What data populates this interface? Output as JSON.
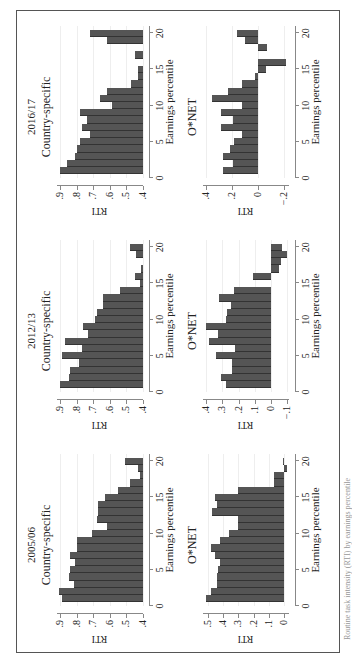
{
  "figure": {
    "caption": "Routine task intensity (RTI) by earnings percentile"
  },
  "columns": [
    {
      "year": "2005/06"
    },
    {
      "year": "2012/13"
    },
    {
      "year": "2016/17"
    }
  ],
  "chart_data": [
    {
      "type": "bar",
      "title": "2005/06 — Country-specific",
      "panel_label": "Country-specific",
      "xlabel": "Earnings percentile",
      "ylabel": "RTI",
      "x": [
        1,
        2,
        3,
        4,
        5,
        6,
        7,
        8,
        9,
        10,
        11,
        12,
        13,
        14,
        15,
        16,
        17,
        18,
        19,
        20
      ],
      "values": [
        0.89,
        0.91,
        0.82,
        0.85,
        0.84,
        0.81,
        0.84,
        0.8,
        0.8,
        0.71,
        0.62,
        0.68,
        0.67,
        0.67,
        0.63,
        0.55,
        0.48,
        0.42,
        0.43,
        0.51
      ],
      "xticks": [
        0,
        5,
        10,
        15,
        20
      ],
      "yticks": [
        ".4",
        ".5",
        ".6",
        ".7",
        ".8",
        ".9"
      ],
      "ylim": [
        0.4,
        0.92
      ],
      "xlim": [
        0,
        21
      ],
      "grid": true
    },
    {
      "type": "bar",
      "title": "2005/06 — O*NET",
      "panel_label": "O*NET",
      "xlabel": "Earnings percentile",
      "ylabel": "RTI",
      "x": [
        1,
        2,
        3,
        4,
        5,
        6,
        7,
        8,
        9,
        10,
        11,
        12,
        13,
        14,
        15,
        16,
        17,
        18,
        19,
        20
      ],
      "values": [
        0.51,
        0.48,
        0.44,
        0.44,
        0.43,
        0.42,
        0.45,
        0.48,
        0.42,
        0.36,
        0.3,
        0.3,
        0.47,
        0.44,
        0.45,
        0.3,
        0.07,
        0.07,
        -0.02,
        0.01
      ],
      "xticks": [
        0,
        5,
        10,
        15,
        20
      ],
      "yticks": [
        "0",
        ".1",
        ".2",
        ".3",
        ".4",
        ".5"
      ],
      "ylim": [
        -0.03,
        0.53
      ],
      "xlim": [
        0,
        21
      ],
      "grid": true
    },
    {
      "type": "bar",
      "title": "2012/13 — Country-specific",
      "panel_label": "Country-specific",
      "xlabel": "Earnings percentile",
      "ylabel": "RTI",
      "x": [
        1,
        2,
        3,
        4,
        5,
        6,
        7,
        8,
        9,
        10,
        11,
        12,
        13,
        14,
        15,
        16,
        17,
        18,
        19,
        20
      ],
      "values": [
        0.9,
        0.85,
        0.84,
        0.79,
        0.89,
        0.77,
        0.87,
        0.73,
        0.76,
        0.69,
        0.68,
        0.64,
        0.64,
        0.54,
        0.42,
        0.45,
        0.41,
        0.4,
        0.44,
        0.48
      ],
      "xticks": [
        0,
        5,
        10,
        15,
        20
      ],
      "yticks": [
        ".4",
        ".5",
        ".6",
        ".7",
        ".8",
        ".9"
      ],
      "ylim": [
        0.4,
        0.92
      ],
      "xlim": [
        0,
        21
      ],
      "grid": true
    },
    {
      "type": "bar",
      "title": "2012/13 — O*NET",
      "panel_label": "O*NET",
      "xlabel": "Earnings percentile",
      "ylabel": "RTI",
      "x": [
        1,
        2,
        3,
        4,
        5,
        6,
        7,
        8,
        9,
        10,
        11,
        12,
        13,
        14,
        15,
        16,
        17,
        18,
        19,
        20
      ],
      "values": [
        0.28,
        0.31,
        0.24,
        0.24,
        0.34,
        0.22,
        0.38,
        0.33,
        0.4,
        0.28,
        0.27,
        0.25,
        0.32,
        0.23,
        0.0,
        0.11,
        -0.05,
        -0.06,
        -0.1,
        -0.07
      ],
      "xticks": [
        0,
        5,
        10,
        15,
        20
      ],
      "yticks": [
        "−.1",
        "0",
        ".1",
        ".2",
        ".3",
        ".4"
      ],
      "ylim": [
        -0.11,
        0.42
      ],
      "xlim": [
        0,
        21
      ],
      "grid": true
    },
    {
      "type": "bar",
      "title": "2016/17 — Country-specific",
      "panel_label": "Country-specific",
      "xlabel": "Earnings percentile",
      "ylabel": "RTI",
      "x": [
        1,
        2,
        3,
        4,
        5,
        6,
        7,
        8,
        9,
        10,
        11,
        12,
        13,
        14,
        15,
        16,
        17,
        18,
        19,
        20
      ],
      "values": [
        0.9,
        0.86,
        0.81,
        0.8,
        0.78,
        0.72,
        0.77,
        0.74,
        0.78,
        0.59,
        0.66,
        0.62,
        0.47,
        0.43,
        0.43,
        0.4,
        0.45,
        0.4,
        0.62,
        0.72
      ],
      "xticks": [
        0,
        5,
        10,
        15,
        20
      ],
      "yticks": [
        ".4",
        ".5",
        ".6",
        ".7",
        ".8",
        ".9"
      ],
      "ylim": [
        0.4,
        0.92
      ],
      "xlim": [
        0,
        21
      ],
      "grid": true
    },
    {
      "type": "bar",
      "title": "2016/17 — O*NET",
      "panel_label": "O*NET",
      "xlabel": "Earnings percentile",
      "ylabel": "RTI",
      "x": [
        1,
        2,
        3,
        4,
        5,
        6,
        7,
        8,
        9,
        10,
        11,
        12,
        13,
        14,
        15,
        16,
        17,
        18,
        19,
        20
      ],
      "values": [
        0.27,
        0.19,
        0.27,
        0.21,
        0.18,
        0.12,
        0.28,
        0.19,
        0.28,
        0.12,
        0.35,
        0.23,
        0.12,
        0.02,
        -0.06,
        -0.22,
        0.0,
        -0.07,
        0.1,
        0.16
      ],
      "xticks": [
        0,
        5,
        10,
        15,
        20
      ],
      "yticks": [
        "−.2",
        "0",
        ".2",
        ".4"
      ],
      "ytick_values": [
        -0.2,
        0,
        0.2,
        0.4
      ],
      "ylim": [
        -0.24,
        0.42
      ],
      "xlim": [
        0,
        21
      ],
      "grid": true
    }
  ]
}
